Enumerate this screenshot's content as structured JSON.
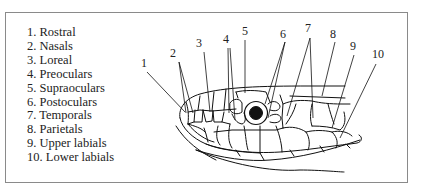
{
  "figure": {
    "legend": [
      "1. Rostral",
      "2. Nasals",
      "3. Loreal",
      "4. Preoculars",
      "5. Supraoculars",
      "6. Postoculars",
      "7. Temporals",
      "8. Parietals",
      "9. Upper labials",
      "10. Lower labials"
    ],
    "callouts": [
      "1",
      "2",
      "3",
      "4",
      "5",
      "6",
      "7",
      "8",
      "9",
      "10"
    ],
    "colors": {
      "line": "#111111",
      "border": "#8a8a8a",
      "text": "#222222",
      "background": "#ffffff"
    }
  }
}
